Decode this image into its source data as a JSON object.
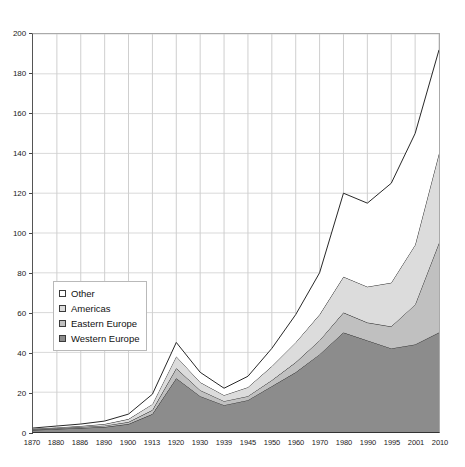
{
  "chart_data": {
    "type": "area",
    "title": "",
    "subtitle": "",
    "xlabel": "",
    "ylabel": "",
    "stacked": true,
    "grid": true,
    "legend_position": "inner-left",
    "ylim": [
      0,
      200
    ],
    "yticks": [
      0,
      20,
      40,
      60,
      80,
      100,
      120,
      140,
      160,
      180,
      200
    ],
    "categories": [
      "1870",
      "1880",
      "1886",
      "1890",
      "1900",
      "1913",
      "1920",
      "1930",
      "1939",
      "1945",
      "1950",
      "1960",
      "1970",
      "1980",
      "1990",
      "1995",
      "2001",
      "2010"
    ],
    "series": [
      {
        "name": "Western Europe",
        "color": "#8c8c8c",
        "values": [
          1.0,
          1.5,
          2.0,
          2.5,
          4.0,
          9.0,
          27.0,
          18.0,
          13.5,
          16.0,
          23.0,
          30.0,
          39.0,
          50.0,
          46.0,
          42.0,
          44.0,
          50.0
        ]
      },
      {
        "name": "Eastern Europe",
        "color": "#c0c0c0",
        "values": [
          0.3,
          0.4,
          0.5,
          0.7,
          1.0,
          2.0,
          5.0,
          3.0,
          2.0,
          2.0,
          3.0,
          5.0,
          7.0,
          10.0,
          9.0,
          11.0,
          20.0,
          45.0
        ]
      },
      {
        "name": "Americas",
        "color": "#dcdcdc",
        "values": [
          0.3,
          0.4,
          0.5,
          0.8,
          1.5,
          3.0,
          6.0,
          4.0,
          3.0,
          4.5,
          7.0,
          10.0,
          13.0,
          18.0,
          18.0,
          22.0,
          30.0,
          45.0
        ]
      },
      {
        "name": "Other",
        "color": "#ffffff",
        "values": [
          0.4,
          0.7,
          1.0,
          1.5,
          2.5,
          5.0,
          7.0,
          5.0,
          3.5,
          5.5,
          9.0,
          14.0,
          21.0,
          42.0,
          42.0,
          50.0,
          56.0,
          52.0
        ]
      }
    ],
    "totals": [
      2.0,
      3.0,
      4.0,
      5.5,
      9.0,
      19.0,
      45.0,
      30.0,
      22.0,
      28.0,
      42.0,
      59.0,
      80.0,
      120.0,
      115.0,
      125.0,
      150.0,
      192.0
    ]
  },
  "legend": {
    "items": [
      {
        "label": "Other",
        "swatch": "#ffffff"
      },
      {
        "label": "Americas",
        "swatch": "#dcdcdc"
      },
      {
        "label": "Eastern Europe",
        "swatch": "#c0c0c0"
      },
      {
        "label": "Western Europe",
        "swatch": "#8c8c8c"
      }
    ]
  },
  "axis_colors": {
    "grid": "#d9d9d9",
    "axis": "#333333",
    "outline": "#262626",
    "text": "#1a1a1a"
  }
}
